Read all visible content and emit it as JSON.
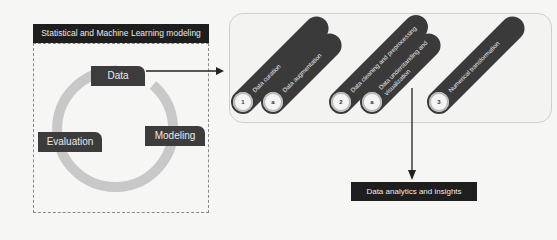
{
  "modeling_panel": {
    "title": "Statistical and Machine Learning modeling",
    "cycle_stages": [
      {
        "label": "Data"
      },
      {
        "label": "Modeling"
      },
      {
        "label": "Evaluation"
      }
    ]
  },
  "pipeline": {
    "steps": [
      {
        "marker": "1",
        "label": "Data curation"
      },
      {
        "marker": "a",
        "label": "Data augmentation"
      },
      {
        "marker": "2",
        "label": "Data cleaning and preprocessing"
      },
      {
        "marker": "a",
        "label": "Data understanding and visualization"
      },
      {
        "marker": "3",
        "label": "Numerical transformation"
      }
    ]
  },
  "output": {
    "label": "Data analytics and insights"
  },
  "colors": {
    "dark_box": "#1e1e1e",
    "label_box": "#3c3c3c",
    "cycle_arrow": "#c8c8c8",
    "pill": "#3a3a3a"
  }
}
